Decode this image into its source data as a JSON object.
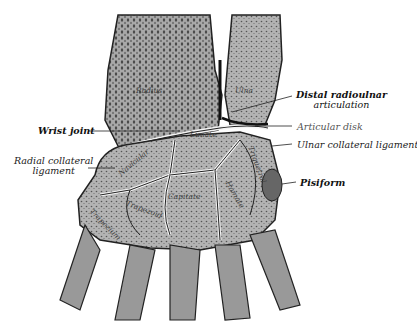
{
  "figure": {
    "labels_left": [
      {
        "id": "wrist-joint",
        "text": "Wrist joint",
        "bold": true
      },
      {
        "id": "radial-collateral",
        "line1": "Radial collateral",
        "line2": "ligament",
        "bold": false
      }
    ],
    "labels_right": [
      {
        "id": "distal-radioulnar",
        "line1": "Distal radioulnar",
        "line2": "articulation",
        "bold": true
      },
      {
        "id": "articular-disk",
        "text": "Articular disk",
        "bold": false
      },
      {
        "id": "ulnar-collateral",
        "text": "Ulnar collateral ligament",
        "bold": false
      },
      {
        "id": "pisiform",
        "text": "Pisiform",
        "bold": true
      }
    ],
    "bones": [
      "Radius",
      "Ulna",
      "Lunate",
      "Navicular",
      "Triquetral",
      "Capitate",
      "Hamate",
      "Trapezoid",
      "Trapezium"
    ],
    "colors": {
      "bone_fill": "#9a9a9a",
      "bone_dark": "#555555",
      "cartilage": "#f4f4f4",
      "outline": "#222222",
      "background": "#ffffff"
    }
  }
}
